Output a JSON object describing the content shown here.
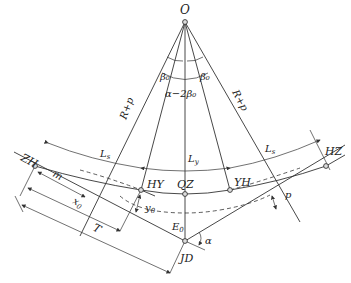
{
  "diagram": {
    "type": "road-curve-transition-geometry",
    "points": {
      "O": "O",
      "ZH": "ZH",
      "HY": "HY",
      "QZ": "QZ",
      "YH": "YH",
      "HZ": "HZ",
      "JD": "JD"
    },
    "labels": {
      "beta_left": "β₀",
      "beta_right": "β₀",
      "center_angle": "α−2β₀",
      "radius_left": "R+p",
      "radius_right": "R+p",
      "ls_left": "L",
      "ls_left_sub": "s",
      "ls_right": "L",
      "ls_right_sub": "s",
      "ly": "L",
      "ly_sub": "y",
      "m": "m",
      "x0": "x",
      "x0_sub": "0",
      "y0": "y",
      "y0_sub": "0",
      "T": "T",
      "E0": "E",
      "E0_sub": "0",
      "alpha": "α",
      "p": "p"
    }
  }
}
